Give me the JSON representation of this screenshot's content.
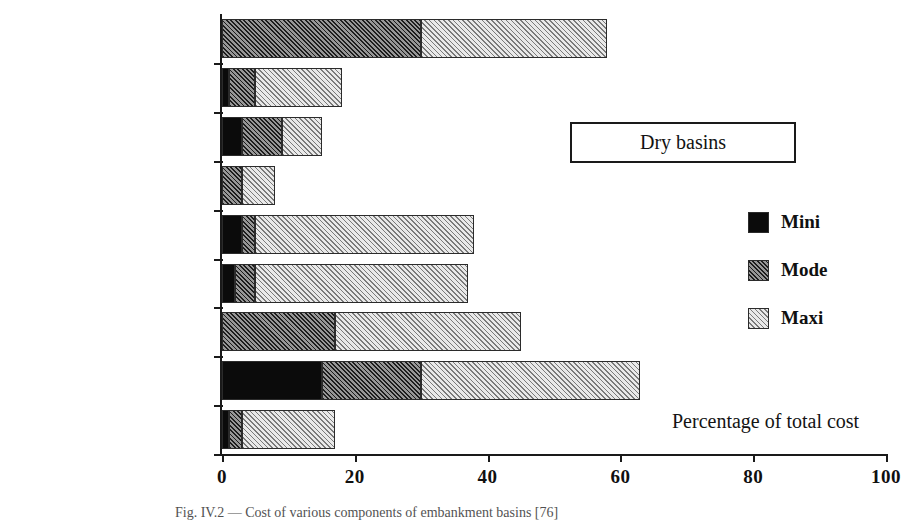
{
  "chart_data": {
    "type": "bar",
    "orientation": "horizontal",
    "stacked": true,
    "title": "Dry basins",
    "xlabel": "Percentage of total cost",
    "ylabel": "",
    "xlim": [
      0,
      100
    ],
    "xticks": [
      0,
      20,
      40,
      60,
      80,
      100
    ],
    "xtick_labels": [
      "0",
      "20",
      "40",
      "60",
      "80",
      "100"
    ],
    "grid": false,
    "legend_position": "right",
    "categories": [
      "Closure dyke",
      "Miscellaneous works",
      "Embankment works",
      "Bank protection",
      "Other works",
      "Evacuation discharge",
      "Impermeabilisation",
      "Earthwork",
      "Preparation"
    ],
    "series": [
      {
        "name": "Mini",
        "color": "#0b0b0b",
        "fill": "solid-black",
        "values": [
          0,
          1,
          3,
          0,
          3,
          2,
          0,
          15,
          1
        ]
      },
      {
        "name": "Mode",
        "color": "#8c8c8c",
        "fill": "dark-hatch",
        "values": [
          30,
          4,
          6,
          3,
          2,
          3,
          17,
          15,
          2
        ]
      },
      {
        "name": "Maxi",
        "color": "#cfcfcf",
        "fill": "light-hatch",
        "values": [
          28,
          13,
          6,
          5,
          33,
          32,
          28,
          33,
          14
        ]
      }
    ],
    "totals": [
      58,
      18,
      15,
      8,
      38,
      37,
      45,
      63,
      17
    ],
    "caption": "Fig. IV.2 — Cost of various components of embankment basins [76]"
  },
  "axis": {
    "x_caption": "Percentage of total cost"
  },
  "legend": {
    "items": [
      {
        "label": "Mini"
      },
      {
        "label": "Mode"
      },
      {
        "label": "Maxi"
      }
    ]
  },
  "title_box": {
    "label": "Dry basins"
  },
  "colors": {
    "mini": "#0b0b0b",
    "mode": "#8c8c8c",
    "maxi": "#cfcfcf",
    "axis": "#1a1a1a",
    "text": "#141414",
    "background": "#ffffff"
  }
}
